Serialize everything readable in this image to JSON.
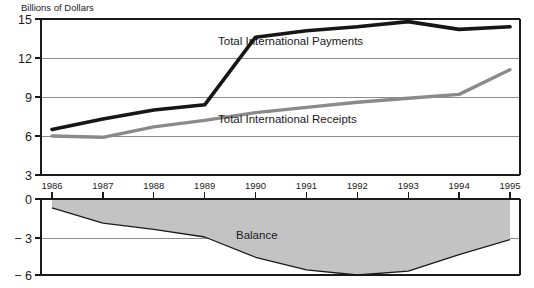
{
  "chart_data": {
    "type": "line",
    "title": "Billions of Dollars",
    "xlabel": "",
    "ylabel": "Billions of Dollars",
    "categories": [
      "1986",
      "1987",
      "1988",
      "1989",
      "1990",
      "1991",
      "1992",
      "1993",
      "1994",
      "1995"
    ],
    "x": [
      1986,
      1987,
      1988,
      1989,
      1990,
      1991,
      1992,
      1993,
      1994,
      1995
    ],
    "upper_panel": {
      "ylim": [
        3,
        15
      ],
      "yticks": [
        15,
        12,
        9,
        6,
        3
      ],
      "ytick_labels": [
        "15",
        "12",
        "9",
        "6",
        "3"
      ],
      "grid": true
    },
    "lower_panel": {
      "ylim": [
        -6,
        0
      ],
      "yticks": [
        0,
        -3,
        -6
      ],
      "ytick_labels": [
        "0",
        "− 3",
        "− 6"
      ],
      "grid": true
    },
    "series": [
      {
        "name": "Total International Payments",
        "label": "Total International Payments",
        "color": "#161616",
        "style": "line",
        "values": [
          6.5,
          7.3,
          8.0,
          8.4,
          13.6,
          14.1,
          14.4,
          14.8,
          14.2,
          14.4
        ]
      },
      {
        "name": "Total International Receipts",
        "label": "Total International Receipts",
        "color": "#8a8a8a",
        "style": "line",
        "values": [
          6.0,
          5.9,
          6.7,
          7.2,
          7.8,
          8.2,
          8.6,
          8.9,
          9.2,
          11.1
        ]
      },
      {
        "name": "Balance",
        "label": "Balance",
        "color": "#c3c3c3",
        "style": "area",
        "values": [
          -0.7,
          -1.9,
          -2.4,
          -3.0,
          -4.6,
          -5.6,
          -6.0,
          -5.7,
          -4.4,
          -3.2
        ]
      }
    ],
    "annotations": [
      {
        "text": "Total International Payments",
        "x": 1991.2,
        "y": 12.6
      },
      {
        "text": "Total International Receipts",
        "x": 1991.2,
        "y": 6.9
      },
      {
        "text": "Balance",
        "x": 1991.6,
        "y": -2.6
      }
    ],
    "legend_position": "inline-annotations",
    "colors": {
      "payments": "#161616",
      "receipts": "#8a8a8a",
      "balance_fill": "#c3c3c3",
      "gridline": "#8c8c8c",
      "axis": "#1a1a1a",
      "background": "#ffffff"
    }
  },
  "axis_title": "Billions of Dollars",
  "ytick_labels_upper": [
    "15",
    "12",
    "9",
    "6",
    "3"
  ],
  "ytick_labels_lower": [
    "0",
    "− 3",
    "− 6"
  ],
  "xtick_labels": [
    "1986",
    "1987",
    "1988",
    "1989",
    "1990",
    "1991",
    "1992",
    "1993",
    "1994",
    "1995"
  ],
  "series_labels": {
    "payments": "Total International Payments",
    "receipts": "Total International Receipts",
    "balance": "Balance"
  }
}
